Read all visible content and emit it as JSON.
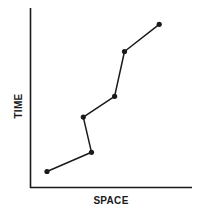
{
  "chart_data": {
    "type": "line",
    "title": "",
    "xlabel": "SPACE",
    "ylabel": "TIME",
    "grid": false,
    "legend": null,
    "ticks": false,
    "xlim": [
      0,
      100
    ],
    "ylim": [
      0,
      100
    ],
    "series": [
      {
        "name": "path",
        "markers": true,
        "points": [
          {
            "x": 10,
            "y": 10
          },
          {
            "x": 37,
            "y": 22
          },
          {
            "x": 32,
            "y": 44
          },
          {
            "x": 51,
            "y": 57
          },
          {
            "x": 57,
            "y": 85
          },
          {
            "x": 78,
            "y": 102
          }
        ]
      }
    ]
  },
  "colors": {
    "line": "#1a1a1a",
    "axis": "#1a1a1a",
    "background": "#ffffff"
  }
}
